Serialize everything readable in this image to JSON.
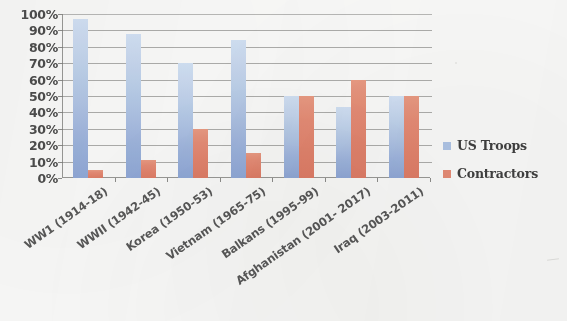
{
  "chart_data": {
    "type": "bar",
    "title": "",
    "xlabel": "",
    "ylabel": "",
    "ylim": [
      0,
      100
    ],
    "grid": true,
    "legend_position": "right",
    "categories": [
      "WW1 (1914-18)",
      "WWII (1942-45)",
      "Korea (1950-53)",
      "Vietnam (1965-75)",
      "Balkans (1995-99)",
      "Afghanistan (2001- 2017)",
      "Iraq  (2003-2011)"
    ],
    "ytick_labels": [
      "100%",
      "90%",
      "80%",
      "70%",
      "60%",
      "50%",
      "40%",
      "30%",
      "20%",
      "10%",
      "0%"
    ],
    "ytick_values": [
      100,
      90,
      80,
      70,
      60,
      50,
      40,
      30,
      20,
      10,
      0
    ],
    "series": [
      {
        "name": "US Troops",
        "color": "#aec6ea",
        "values": [
          97,
          88,
          70,
          84,
          50,
          43,
          50
        ]
      },
      {
        "name": "Contractors",
        "color": "#ec8a72",
        "values": [
          5,
          11,
          30,
          15,
          50,
          60,
          50
        ]
      }
    ]
  },
  "legend": {
    "items": [
      {
        "label": "US Troops",
        "swatch": "troops"
      },
      {
        "label": "Contractors",
        "swatch": "contractors"
      }
    ]
  }
}
